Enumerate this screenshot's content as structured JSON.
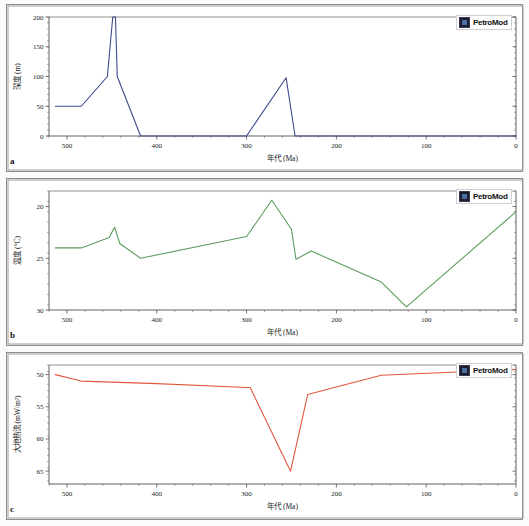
{
  "figure": {
    "background": "#fbfbf9",
    "panel_count": 3,
    "shared_xlabel": "年代 (Ma)",
    "legend_label": "PetroMod",
    "legend_icon": "petromod-logo-icon"
  },
  "panels": [
    {
      "letter": "a",
      "name": "burial-depth-panel"
    },
    {
      "letter": "b",
      "name": "temperature-panel"
    },
    {
      "letter": "c",
      "name": "heat-flow-panel"
    }
  ],
  "chart_data": [
    {
      "type": "line",
      "panel": "a",
      "title": "",
      "xlabel": "年代 (Ma)",
      "ylabel": "深度 (m)",
      "xlim": [
        520,
        0
      ],
      "ylim": [
        200,
        0
      ],
      "y_inverted": true,
      "grid": false,
      "legend_position": "top-right",
      "legend": [
        "PetroMod"
      ],
      "color": "#3d4a8c",
      "xticks": [
        500,
        400,
        300,
        200,
        100,
        0
      ],
      "yticks": [
        0,
        50,
        100,
        150,
        200
      ],
      "x": [
        513,
        484,
        455,
        450,
        448,
        445,
        418,
        382,
        300,
        255,
        245,
        240,
        0
      ],
      "y": [
        50,
        50,
        100,
        200,
        200,
        100,
        0,
        0,
        0,
        98,
        0,
        0,
        0
      ],
      "series": [
        {
          "name": "埋藏深度",
          "points": [
            {
              "x": 513,
              "y": 50
            },
            {
              "x": 484,
              "y": 50
            },
            {
              "x": 455,
              "y": 100
            },
            {
              "x": 449,
              "y": 200
            },
            {
              "x": 446,
              "y": 200
            },
            {
              "x": 444,
              "y": 100
            },
            {
              "x": 418,
              "y": 0
            },
            {
              "x": 382,
              "y": 0
            },
            {
              "x": 300,
              "y": 0
            },
            {
              "x": 256,
              "y": 98
            },
            {
              "x": 246,
              "y": 0
            },
            {
              "x": 0,
              "y": 0
            }
          ]
        }
      ]
    },
    {
      "type": "line",
      "panel": "b",
      "title": "",
      "xlabel": "年代 (Ma)",
      "ylabel": "温度 (°C)",
      "xlim": [
        520,
        0
      ],
      "ylim": [
        18.5,
        30
      ],
      "y_inverted": false,
      "grid": false,
      "legend_position": "top-right",
      "legend": [
        "PetroMod"
      ],
      "color": "#5e9c5e",
      "xticks": [
        500,
        400,
        300,
        200,
        100,
        0
      ],
      "yticks": [
        20,
        25,
        30
      ],
      "series": [
        {
          "name": "温度",
          "points": [
            {
              "x": 513,
              "y": 24.0
            },
            {
              "x": 484,
              "y": 24.0
            },
            {
              "x": 453,
              "y": 23.0
            },
            {
              "x": 447,
              "y": 22.0
            },
            {
              "x": 441,
              "y": 23.6
            },
            {
              "x": 418,
              "y": 25.0
            },
            {
              "x": 300,
              "y": 22.9
            },
            {
              "x": 272,
              "y": 19.4
            },
            {
              "x": 250,
              "y": 22.2
            },
            {
              "x": 245,
              "y": 25.1
            },
            {
              "x": 228,
              "y": 24.3
            },
            {
              "x": 150,
              "y": 27.3
            },
            {
              "x": 122,
              "y": 29.7
            },
            {
              "x": 0,
              "y": 20.5
            }
          ]
        }
      ]
    },
    {
      "type": "line",
      "panel": "c",
      "title": "",
      "xlabel": "年代 (Ma)",
      "ylabel": "大地热流 (mW/m²)",
      "xlim": [
        520,
        0
      ],
      "ylim": [
        48.5,
        67
      ],
      "y_inverted": false,
      "grid": false,
      "legend_position": "top-right",
      "legend": [
        "PetroMod"
      ],
      "color": "#e0583c",
      "xticks": [
        500,
        400,
        300,
        200,
        100,
        0
      ],
      "yticks": [
        50,
        55,
        60,
        65
      ],
      "series": [
        {
          "name": "大地热流",
          "points": [
            {
              "x": 513,
              "y": 50.0
            },
            {
              "x": 484,
              "y": 51.0
            },
            {
              "x": 400,
              "y": 51.4
            },
            {
              "x": 300,
              "y": 52.0
            },
            {
              "x": 296,
              "y": 52.0
            },
            {
              "x": 251,
              "y": 65.0
            },
            {
              "x": 232,
              "y": 53.1
            },
            {
              "x": 150,
              "y": 50.1
            },
            {
              "x": 0,
              "y": 49.2
            }
          ]
        }
      ]
    }
  ]
}
